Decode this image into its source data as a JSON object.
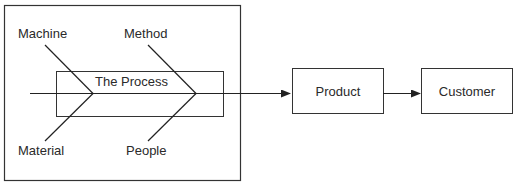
{
  "diagram": {
    "type": "fishbone-flow",
    "process_label": "The Process",
    "bones": {
      "machine": "Machine",
      "method": "Method",
      "material": "Material",
      "people": "People"
    },
    "flow": {
      "product": "Product",
      "customer": "Customer"
    },
    "colors": {
      "line": "#222222",
      "text": "#2a2a2a",
      "background": "#ffffff"
    }
  }
}
